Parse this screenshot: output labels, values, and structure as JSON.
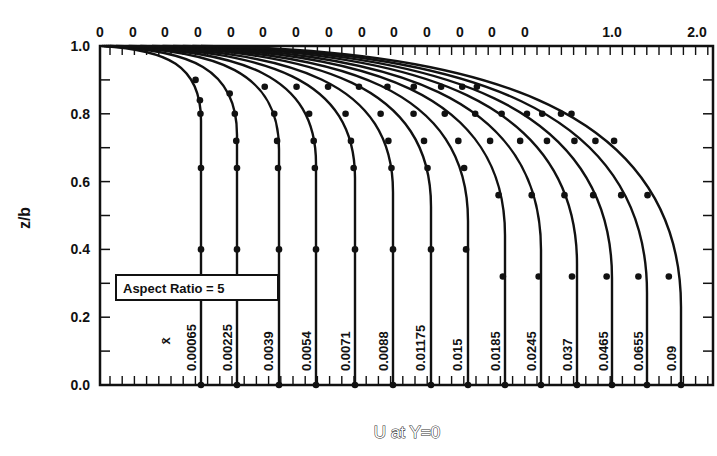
{
  "chart_data": {
    "type": "line",
    "title": "",
    "xlabel": "U at Y=0",
    "ylabel": "z/b",
    "ylim": [
      0.0,
      1.0
    ],
    "yticks": [
      "0.0",
      "0.2",
      "0.4",
      "0.6",
      "0.8",
      "1.0"
    ],
    "top_tick_labels": [
      "0",
      "0",
      "0",
      "0",
      "0",
      "0",
      "0",
      "0",
      "0",
      "0",
      "0",
      "0",
      "0",
      "0",
      "1.0",
      "2.0"
    ],
    "annotation": "Aspect Ratio = 5",
    "series_label_symbol": "x̄",
    "grid": false,
    "legend_position": "inset-left",
    "note": "Successive velocity profiles, each offset along the x axis; curves are theory, dots are measured data",
    "series": [
      {
        "name": "0.00065",
        "u_center": 1.0,
        "z": [
          0.0,
          0.4,
          0.64,
          0.8,
          0.84,
          0.9
        ],
        "u": [
          1.0,
          1.0,
          1.0,
          0.99,
          0.98,
          0.9
        ]
      },
      {
        "name": "0.00225",
        "u_center": 1.0,
        "z": [
          0.0,
          0.4,
          0.64,
          0.72,
          0.8,
          0.86
        ],
        "u": [
          1.0,
          1.0,
          1.0,
          0.99,
          0.97,
          0.9
        ]
      },
      {
        "name": "0.0039",
        "u_center": 1.0,
        "z": [
          0.0,
          0.4,
          0.64,
          0.72,
          0.8,
          0.88
        ],
        "u": [
          1.0,
          1.0,
          0.99,
          0.98,
          0.95,
          0.85
        ]
      },
      {
        "name": "0.0054",
        "u_center": 1.0,
        "z": [
          0.0,
          0.4,
          0.64,
          0.72,
          0.8,
          0.88
        ],
        "u": [
          1.0,
          1.0,
          0.99,
          0.98,
          0.94,
          0.83
        ]
      },
      {
        "name": "0.0071",
        "u_center": 1.0,
        "z": [
          0.0,
          0.4,
          0.64,
          0.72,
          0.8,
          0.88
        ],
        "u": [
          1.0,
          1.0,
          0.99,
          0.97,
          0.93,
          0.8
        ]
      },
      {
        "name": "0.0088",
        "u_center": 1.0,
        "z": [
          0.0,
          0.4,
          0.64,
          0.72,
          0.8,
          0.88
        ],
        "u": [
          1.0,
          1.0,
          0.99,
          0.97,
          0.92,
          0.78
        ]
      },
      {
        "name": "0.01175",
        "u_center": 1.0,
        "z": [
          0.0,
          0.4,
          0.64,
          0.72,
          0.8,
          0.88
        ],
        "u": [
          1.0,
          1.0,
          0.98,
          0.96,
          0.9,
          0.75
        ]
      },
      {
        "name": "0.015",
        "u_center": 1.0,
        "z": [
          0.0,
          0.4,
          0.64,
          0.72,
          0.8,
          0.88
        ],
        "u": [
          1.0,
          0.99,
          0.98,
          0.95,
          0.88,
          0.72
        ]
      },
      {
        "name": "0.0185",
        "u_center": 1.0,
        "z": [
          0.0,
          0.32,
          0.56,
          0.72,
          0.8,
          0.88
        ],
        "u": [
          1.0,
          0.99,
          0.97,
          0.93,
          0.86,
          0.7
        ]
      },
      {
        "name": "0.0245",
        "u_center": 1.0,
        "z": [
          0.0,
          0.32,
          0.56,
          0.72,
          0.8,
          0.88
        ],
        "u": [
          1.0,
          0.99,
          0.96,
          0.91,
          0.83,
          0.66
        ]
      },
      {
        "name": "0.037",
        "u_center": 1.0,
        "z": [
          0.0,
          0.32,
          0.56,
          0.72,
          0.8,
          0.88
        ],
        "u": [
          1.0,
          0.98,
          0.95,
          0.88,
          0.8,
          0.6
        ]
      },
      {
        "name": "0.0465",
        "u_center": 1.0,
        "z": [
          0.0,
          0.32,
          0.56,
          0.72,
          0.8
        ],
        "u": [
          1.0,
          0.98,
          0.93,
          0.86,
          0.74
        ]
      },
      {
        "name": "0.0655",
        "u_center": 1.0,
        "z": [
          0.0,
          0.32,
          0.56,
          0.72,
          0.8
        ],
        "u": [
          1.0,
          0.97,
          0.91,
          0.82,
          0.7
        ]
      },
      {
        "name": "0.09",
        "u_center": 1.0,
        "z": [
          0.0,
          0.32,
          0.56,
          0.72,
          0.8
        ],
        "u": [
          1.0,
          0.96,
          0.89,
          0.78,
          0.64
        ]
      }
    ]
  },
  "layout": {
    "frame": {
      "left": 100,
      "top": 46,
      "right": 713,
      "bottom": 385
    },
    "curve_bottom_x": [
      201,
      237,
      279,
      316,
      355,
      393,
      431,
      468,
      505,
      541,
      577,
      612,
      647,
      681
    ],
    "curve_label_x": [
      196,
      232,
      273,
      311,
      350,
      388,
      425,
      462,
      500,
      536,
      572,
      608,
      643,
      676
    ]
  }
}
